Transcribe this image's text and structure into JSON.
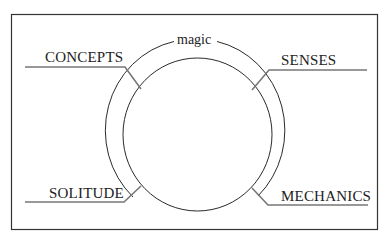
{
  "diagram": {
    "center_label": "magic",
    "labels": {
      "top_left": "CONCEPTS",
      "top_right": "SENSES",
      "bottom_left": "SOLITUDE",
      "bottom_right": "MECHANICS"
    },
    "colors": {
      "stroke": "#2a2a2a",
      "leader": "#777777",
      "frame": "#333333",
      "background": "#ffffff"
    }
  }
}
